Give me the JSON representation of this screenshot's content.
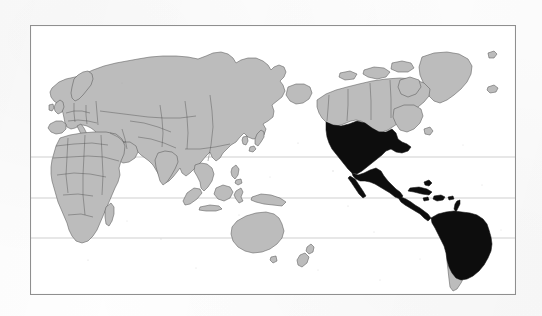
{
  "figure": {
    "kind": "world-map",
    "projection": "pacific-centered-equirectangular",
    "frame": {
      "x": 30,
      "y": 25,
      "width": 486,
      "height": 270,
      "stroke": "#8f8f8f",
      "stroke_width": 1.1
    },
    "background_color": "#fefefe",
    "ocean_color": "#ffffff"
  },
  "legend_colors": {
    "highlighted_land": "#0a0a0a",
    "other_land": "#bcbcbc",
    "country_border": "#4a4a4a",
    "gridline": "#c9c9c9"
  },
  "gridlines": [
    {
      "name": "Tropic of Cancer",
      "y": 132
    },
    {
      "name": "Equator",
      "y": 173
    },
    {
      "name": "Tropic of Capricorn",
      "y": 213
    }
  ],
  "highlighted_regions": [
    "United States",
    "Mexico",
    "Guatemala",
    "Belize",
    "Honduras",
    "El Salvador",
    "Nicaragua",
    "Costa Rica",
    "Panama",
    "Cuba",
    "Hispaniola",
    "Jamaica",
    "Puerto Rico",
    "Lesser Antilles",
    "Colombia",
    "Venezuela",
    "Guyana",
    "Suriname",
    "French Guiana",
    "Ecuador",
    "Peru",
    "Brazil",
    "Bolivia",
    "Paraguay",
    "Uruguay",
    "Northern Argentina"
  ],
  "unhighlighted_regions": [
    "Canada",
    "Alaska",
    "Greenland",
    "Iceland",
    "Europe",
    "Russia",
    "China",
    "India",
    "Japan",
    "Southeast Asia",
    "Indonesia",
    "Philippines",
    "Africa",
    "Madagascar",
    "Middle East",
    "Australia",
    "New Zealand",
    "Papua New Guinea",
    "Chile",
    "Southern Argentina"
  ]
}
